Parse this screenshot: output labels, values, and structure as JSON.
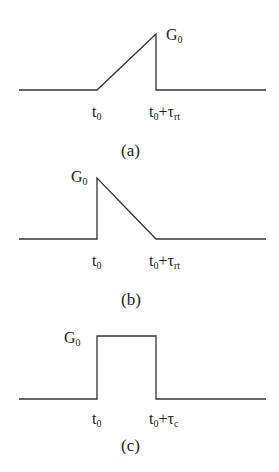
{
  "panels": [
    {
      "caption": "(a)",
      "shape": "rising-ramp-then-drop",
      "amplitude_label": {
        "main": "G",
        "sub": "0"
      },
      "start_label": {
        "main": "t",
        "sub": "0"
      },
      "end_label": {
        "main": "t",
        "sub": "0",
        "op": "+τ",
        "op_sub": "rt"
      }
    },
    {
      "caption": "(b)",
      "shape": "step-up-then-falling-ramp",
      "amplitude_label": {
        "main": "G",
        "sub": "0"
      },
      "start_label": {
        "main": "t",
        "sub": "0"
      },
      "end_label": {
        "main": "t",
        "sub": "0",
        "op": "+τ",
        "op_sub": "rt"
      }
    },
    {
      "caption": "(c)",
      "shape": "rectangular-pulse",
      "amplitude_label": {
        "main": "G",
        "sub": "0"
      },
      "start_label": {
        "main": "t",
        "sub": "0"
      },
      "end_label": {
        "main": "t",
        "sub": "0",
        "op": "+τ",
        "op_sub": "c"
      }
    }
  ],
  "colors": {
    "line": "#333333",
    "text": "#222222"
  }
}
